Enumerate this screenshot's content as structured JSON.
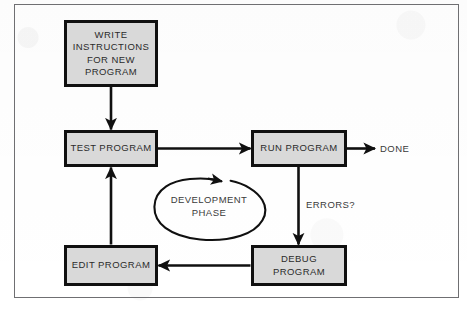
{
  "diagram": {
    "colors": {
      "node_fill": "#d9d9d9",
      "node_border": "#101010",
      "frame_border": "#6f6f72",
      "text": "#2b2b2b",
      "background": "#ffffff"
    },
    "nodes": [
      {
        "id": "write",
        "label": "WRITE\nINSTRUCTIONS\nFOR NEW\nPROGRAM"
      },
      {
        "id": "test",
        "label": "TEST PROGRAM"
      },
      {
        "id": "run",
        "label": "RUN PROGRAM"
      },
      {
        "id": "debug",
        "label": "DEBUG\nPROGRAM"
      },
      {
        "id": "edit",
        "label": "EDIT PROGRAM"
      }
    ],
    "edge_labels": {
      "done": "DONE",
      "errors": "ERRORS?"
    },
    "cycle_label": "DEVELOPMENT\nPHASE",
    "edges": [
      {
        "from": "write",
        "to": "test",
        "direction": "down"
      },
      {
        "from": "test",
        "to": "run",
        "direction": "right"
      },
      {
        "from": "run",
        "to": "done",
        "direction": "right"
      },
      {
        "from": "run",
        "to": "debug",
        "direction": "down",
        "label": "ERRORS?"
      },
      {
        "from": "debug",
        "to": "edit",
        "direction": "left"
      },
      {
        "from": "edit",
        "to": "test",
        "direction": "up"
      }
    ]
  }
}
